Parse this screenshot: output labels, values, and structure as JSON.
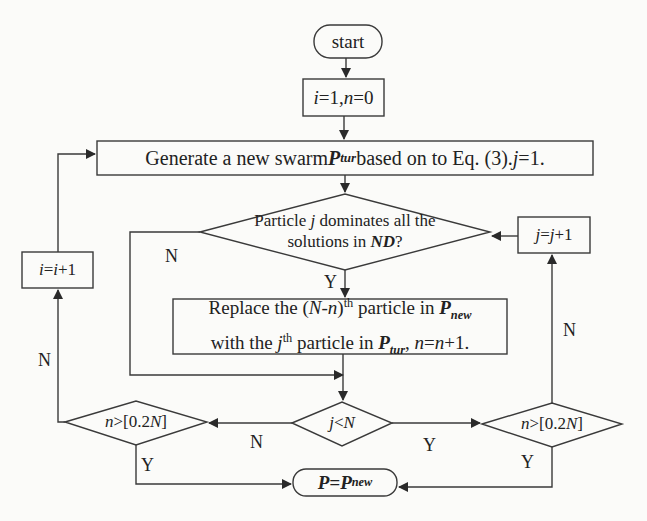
{
  "diagram": {
    "type": "flowchart",
    "nodes": {
      "start": {
        "label": "start",
        "shape": "terminator"
      },
      "init": {
        "label_parts": [
          "i",
          "=1,",
          "n",
          "=0"
        ],
        "shape": "process"
      },
      "generate": {
        "label_parts": [
          "Generate a new swarm ",
          "P",
          "tur",
          " based on to Eq. (3). ",
          "j",
          "=1."
        ],
        "shape": "process"
      },
      "dominates": {
        "line1_parts": [
          "Particle ",
          "j",
          " dominates all the"
        ],
        "line2_parts": [
          "solutions in ",
          "ND",
          "?"
        ],
        "shape": "decision"
      },
      "increment_j": {
        "label_parts": [
          "j",
          "=",
          "j",
          "+1"
        ],
        "shape": "process"
      },
      "increment_i": {
        "label_parts": [
          "i",
          "=",
          "i",
          "+1"
        ],
        "shape": "process"
      },
      "replace": {
        "line1_parts": [
          "Replace the (",
          "N",
          "-",
          "n",
          ")",
          "th",
          " particle in ",
          "P",
          "new"
        ],
        "line2_parts": [
          "with the ",
          "j",
          "th",
          " particle in ",
          "P",
          "tur",
          ", ",
          "n",
          "=",
          "n",
          "+1."
        ],
        "shape": "process"
      },
      "j_less_n": {
        "label_parts": [
          "j",
          "<",
          "N"
        ],
        "shape": "decision"
      },
      "n_gt_left": {
        "label_parts": [
          "n",
          ">[0.2",
          "N",
          "]"
        ],
        "shape": "decision"
      },
      "n_gt_right": {
        "label_parts": [
          "n",
          ">[0.2",
          "N",
          "]"
        ],
        "shape": "decision"
      },
      "end": {
        "label_parts": [
          "P",
          "=",
          "P",
          "new"
        ],
        "shape": "terminator"
      }
    },
    "edge_labels": {
      "dominates_no": "N",
      "dominates_yes": "Y",
      "jn_no": "N",
      "jn_yes": "Y",
      "left_no": "N",
      "left_yes": "Y",
      "right_no": "N",
      "right_yes": "Y"
    },
    "edges": [
      {
        "from": "start",
        "to": "init"
      },
      {
        "from": "init",
        "to": "generate"
      },
      {
        "from": "generate",
        "to": "dominates"
      },
      {
        "from": "dominates",
        "to": "replace",
        "label": "Y"
      },
      {
        "from": "dominates",
        "to": "j_less_n",
        "label": "N"
      },
      {
        "from": "replace",
        "to": "j_less_n"
      },
      {
        "from": "j_less_n",
        "to": "n_gt_right",
        "label": "Y"
      },
      {
        "from": "j_less_n",
        "to": "n_gt_left",
        "label": "N"
      },
      {
        "from": "n_gt_right",
        "to": "increment_j",
        "label": "N"
      },
      {
        "from": "n_gt_right",
        "to": "end",
        "label": "Y"
      },
      {
        "from": "increment_j",
        "to": "dominates"
      },
      {
        "from": "n_gt_left",
        "to": "increment_i",
        "label": "N"
      },
      {
        "from": "n_gt_left",
        "to": "end",
        "label": "Y"
      },
      {
        "from": "increment_i",
        "to": "generate"
      }
    ]
  },
  "colors": {
    "line": "#3a3a3a",
    "background": "#fbfbf9",
    "faded_text": "#d9d9d4"
  }
}
